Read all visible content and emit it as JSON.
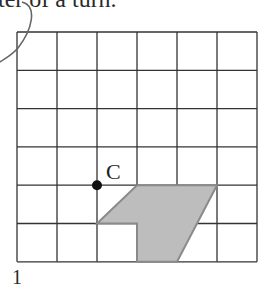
{
  "header": {
    "text": "ter of a turn."
  },
  "footer": {
    "text": "1"
  },
  "grid": {
    "columns": 6,
    "rows": 6,
    "left": 17,
    "top": 32,
    "cell_w": 40,
    "cell_h": 38.3,
    "line_color": "#333333"
  },
  "point": {
    "label": "C",
    "grid_x": 2,
    "grid_y": 4,
    "color": "#111111"
  },
  "shape": {
    "fill": "#bdbdbd",
    "stroke": "#8a8a8a",
    "vertices": [
      [
        3,
        4
      ],
      [
        5,
        4
      ],
      [
        4,
        6
      ],
      [
        3,
        6
      ],
      [
        3,
        5
      ],
      [
        2,
        5
      ]
    ]
  },
  "annotation": {
    "type": "hand-drawn-arc",
    "color": "#555555"
  }
}
